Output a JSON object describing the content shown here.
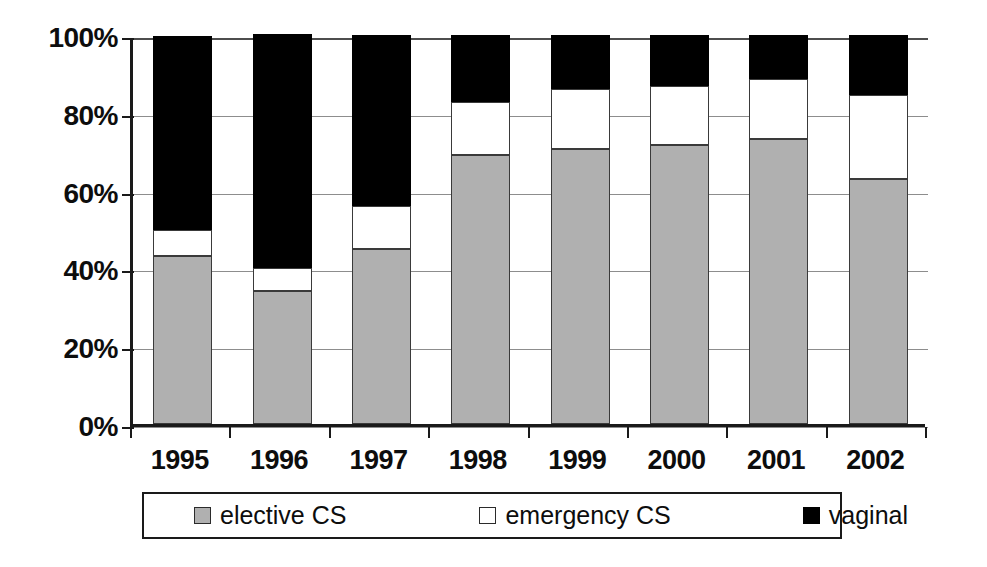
{
  "chart_data": {
    "type": "bar",
    "subtype": "stacked-100-percent",
    "title": "",
    "xlabel": "",
    "ylabel": "",
    "ylim": [
      0,
      100
    ],
    "y_tick_labels": [
      "100%",
      "80%",
      "60%",
      "40%",
      "20%",
      "0%"
    ],
    "y_tick_values": [
      100,
      80,
      60,
      40,
      20,
      0
    ],
    "grid": true,
    "legend_position": "bottom",
    "categories": [
      "1995",
      "1996",
      "1997",
      "1998",
      "1999",
      "2000",
      "2001",
      "2002"
    ],
    "series": [
      {
        "name": "elective CS",
        "color": "#b0b0b0",
        "values": [
          43.2,
          34.2,
          45.0,
          69.2,
          70.7,
          71.7,
          73.3,
          63.0
        ]
      },
      {
        "name": "emergency CS",
        "color": "#ffffff",
        "values": [
          6.7,
          5.9,
          11.0,
          13.6,
          15.4,
          15.2,
          15.4,
          21.6
        ]
      },
      {
        "name": "vaginal",
        "color": "#000000",
        "values": [
          49.9,
          60.1,
          44.0,
          17.2,
          13.9,
          13.1,
          11.3,
          15.4
        ]
      }
    ],
    "cumulative_tops": {
      "elective_CS": [
        43.2,
        34.2,
        45.0,
        69.2,
        70.7,
        71.7,
        73.3,
        63.0
      ],
      "elective_plus_emergency": [
        49.9,
        40.1,
        56.0,
        82.8,
        86.1,
        86.9,
        88.7,
        84.6
      ]
    }
  },
  "axis": {
    "y_labels": [
      "100%",
      "80%",
      "60%",
      "40%",
      "20%",
      "0%"
    ],
    "x_labels": [
      "1995",
      "1996",
      "1997",
      "1998",
      "1999",
      "2000",
      "2001",
      "2002"
    ]
  },
  "legend": {
    "items": [
      {
        "label": "elective CS",
        "swatch": "gray-square-icon"
      },
      {
        "label": "emergency CS",
        "swatch": "white-square-icon"
      },
      {
        "label": "vaginal",
        "swatch": "black-square-icon"
      }
    ]
  },
  "colors": {
    "elective": "#b0b0b0",
    "emergency": "#ffffff",
    "vaginal": "#000000",
    "axis": "#1a1a1a",
    "grid": "#8d8d8d",
    "background": "#ffffff"
  }
}
